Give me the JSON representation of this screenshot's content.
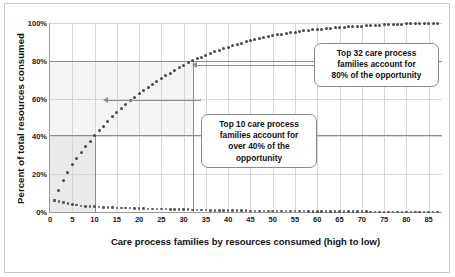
{
  "chart_data": {
    "type": "scatter",
    "title": "",
    "xlabel": "Care process families by resources consumed (high to low)",
    "ylabel": "Percent of total resources consumed",
    "xlim": [
      0,
      88
    ],
    "ylim": [
      0,
      100
    ],
    "grid": true,
    "legend_position": "none",
    "xticks": [
      0,
      5,
      10,
      15,
      20,
      25,
      30,
      35,
      40,
      45,
      50,
      55,
      60,
      65,
      70,
      75,
      80,
      85
    ],
    "yticks": [
      "0%",
      "20%",
      "40%",
      "60%",
      "80%",
      "100%"
    ],
    "ytick_values": [
      0,
      20,
      40,
      60,
      80,
      100
    ],
    "series": [
      {
        "name": "Cumulative percent of total resources consumed",
        "x": [
          1,
          2,
          3,
          4,
          5,
          6,
          7,
          8,
          9,
          10,
          11,
          12,
          13,
          14,
          15,
          16,
          17,
          18,
          19,
          20,
          21,
          22,
          23,
          24,
          25,
          26,
          27,
          28,
          29,
          30,
          31,
          32,
          33,
          34,
          35,
          36,
          37,
          38,
          39,
          40,
          41,
          42,
          43,
          44,
          45,
          46,
          47,
          48,
          49,
          50,
          51,
          52,
          53,
          54,
          55,
          56,
          57,
          58,
          59,
          60,
          61,
          62,
          63,
          64,
          65,
          66,
          67,
          68,
          69,
          70,
          71,
          72,
          73,
          74,
          75,
          76,
          77,
          78,
          79,
          80,
          81,
          82,
          83,
          84,
          85,
          86,
          87
        ],
        "values": [
          6,
          11.5,
          16.5,
          21,
          25,
          28.5,
          31.5,
          34.5,
          37.5,
          40.5,
          43,
          45.5,
          48,
          50.5,
          52.5,
          55,
          57,
          59,
          60.5,
          62.5,
          64.5,
          66,
          67.5,
          69,
          70.5,
          72,
          73.5,
          75,
          76.5,
          77.5,
          79,
          80,
          81,
          82,
          83,
          84,
          84.8,
          85.6,
          86.4,
          87.2,
          88,
          88.7,
          89.4,
          90,
          90.6,
          91.2,
          91.8,
          92.3,
          92.8,
          93.3,
          93.7,
          94.1,
          94.5,
          94.9,
          95.2,
          95.5,
          95.8,
          96.1,
          96.4,
          96.6,
          96.8,
          97,
          97.2,
          97.4,
          97.6,
          97.8,
          98,
          98.1,
          98.3,
          98.4,
          98.6,
          98.7,
          98.8,
          98.9,
          99,
          99.1,
          99.2,
          99.3,
          99.4,
          99.5,
          99.6,
          99.65,
          99.7,
          99.75,
          99.8,
          99.9,
          100
        ]
      },
      {
        "name": "Individual percent of total resources consumed",
        "x": [
          1,
          2,
          3,
          4,
          5,
          6,
          7,
          8,
          9,
          10,
          11,
          12,
          13,
          14,
          15,
          16,
          17,
          18,
          19,
          20,
          21,
          22,
          23,
          24,
          25,
          26,
          27,
          28,
          29,
          30,
          31,
          32,
          33,
          34,
          35,
          36,
          37,
          38,
          39,
          40,
          41,
          42,
          43,
          44,
          45,
          46,
          47,
          48,
          49,
          50,
          51,
          52,
          53,
          54,
          55,
          56,
          57,
          58,
          59,
          60,
          61,
          62,
          63,
          64,
          65,
          66,
          67,
          68,
          69,
          70,
          71,
          72,
          73,
          74,
          75,
          76,
          77,
          78,
          79,
          80,
          81,
          82,
          83,
          84,
          85,
          86,
          87
        ],
        "values": [
          6,
          5.5,
          5,
          4.5,
          4,
          3.6,
          3.2,
          3,
          3,
          3,
          2.6,
          2.5,
          2.5,
          2.4,
          2.2,
          2.2,
          2,
          2,
          1.8,
          1.8,
          1.8,
          1.6,
          1.5,
          1.5,
          1.5,
          1.5,
          1.4,
          1.4,
          1.4,
          1.2,
          1.2,
          1.1,
          1,
          1,
          1,
          0.9,
          0.9,
          0.8,
          0.8,
          0.8,
          0.8,
          0.7,
          0.7,
          0.7,
          0.6,
          0.6,
          0.6,
          0.6,
          0.5,
          0.5,
          0.5,
          0.5,
          0.4,
          0.4,
          0.4,
          0.4,
          0.4,
          0.3,
          0.3,
          0.3,
          0.3,
          0.3,
          0.3,
          0.2,
          0.2,
          0.2,
          0.2,
          0.2,
          0.2,
          0.2,
          0.2,
          0.1,
          0.1,
          0.1,
          0.1,
          0.1,
          0.1,
          0.1,
          0.1,
          0.1,
          0.1,
          0.1,
          0.1,
          0.1,
          0.1,
          0.1,
          0.1
        ]
      }
    ],
    "reference_lines": [
      {
        "name": "forty-percent-line",
        "orientation": "horizontal",
        "value": 40.5
      },
      {
        "name": "eighty-percent-line",
        "orientation": "horizontal",
        "value": 80
      },
      {
        "name": "ten-families-line",
        "orientation": "vertical",
        "value": 10
      },
      {
        "name": "thirtytwo-families-line",
        "orientation": "vertical",
        "value": 32
      }
    ],
    "annotations": [
      {
        "name": "callout-top-32",
        "lines": [
          "Top 32 care process",
          "families account for",
          "80% of the opportunity"
        ],
        "points_to": {
          "x": 32,
          "y": 80
        }
      },
      {
        "name": "callout-top-10",
        "lines": [
          "Top 10 care process",
          "families account for",
          "over 40% of the",
          "opportunity"
        ],
        "points_to": {
          "x": 10,
          "y": 40.5
        }
      }
    ],
    "colors": {
      "dot": "#4a4a4a",
      "reference_line": "#8c8c8c",
      "gridline": "#d5d5d5",
      "axis": "#9a9a9a",
      "shade": "#eaeaea",
      "shade_light": "#f4f4f4",
      "background": "#ffffff",
      "text": "#111111"
    }
  }
}
